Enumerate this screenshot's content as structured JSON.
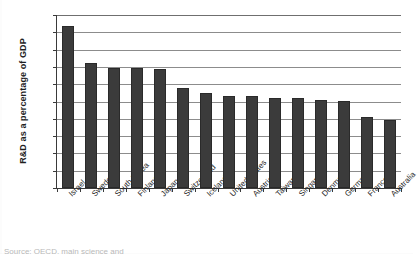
{
  "chart_data": {
    "type": "bar",
    "title": "",
    "xlabel": "",
    "ylabel": "R&D as a percentage of GDP",
    "ylim": [
      0,
      5
    ],
    "ytick_labels": [
      "5",
      "4.5",
      "4",
      "3.5",
      "3",
      "2.5",
      "2",
      "1.5",
      "1",
      "0.5",
      "0"
    ],
    "ytick_values": [
      5,
      4.5,
      4,
      3.5,
      3,
      2.5,
      2,
      1.5,
      1,
      0.5,
      0
    ],
    "grid": "horizontal",
    "legend": "none",
    "bar_color": "#3b3b3b",
    "categories": [
      "Israel",
      "Sweden",
      "South Korea",
      "Finland",
      "Japan",
      "Switzerland",
      "Iceland",
      "United States",
      "Austria",
      "Taiwan",
      "Singapore",
      "Denmark",
      "Germany",
      "France",
      "Australia"
    ],
    "values": [
      4.67,
      3.6,
      3.48,
      3.47,
      3.44,
      2.89,
      2.75,
      2.67,
      2.65,
      2.61,
      2.6,
      2.53,
      2.52,
      2.05,
      1.97
    ]
  },
  "source_note": "Source: OECD, main science and"
}
